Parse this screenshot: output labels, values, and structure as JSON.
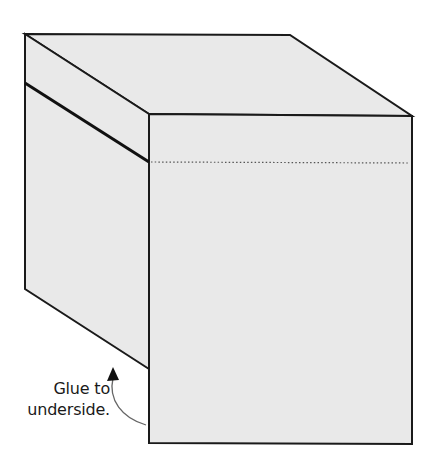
{
  "diagram": {
    "label": {
      "line1": "Glue to",
      "line2": "underside."
    },
    "colors": {
      "face_fill": "#e9e9e9",
      "outline": "#1a1a1a",
      "fold_line": "#555555",
      "arrow": "#666666"
    },
    "faces": [
      {
        "name": "top-face",
        "points": "25,34 290,35 412,116 149,114"
      },
      {
        "name": "left-face",
        "points": "25,34 149,114 149,369 25,289"
      },
      {
        "name": "front-face",
        "points": "149,114 412,116 412,444 149,443"
      }
    ],
    "lines": {
      "flap_crease": {
        "x1": 25,
        "y1": 83,
        "x2": 149,
        "y2": 162
      },
      "dotted_fold": {
        "x1": 151,
        "y1": 162,
        "x2": 410,
        "y2": 163
      }
    }
  }
}
